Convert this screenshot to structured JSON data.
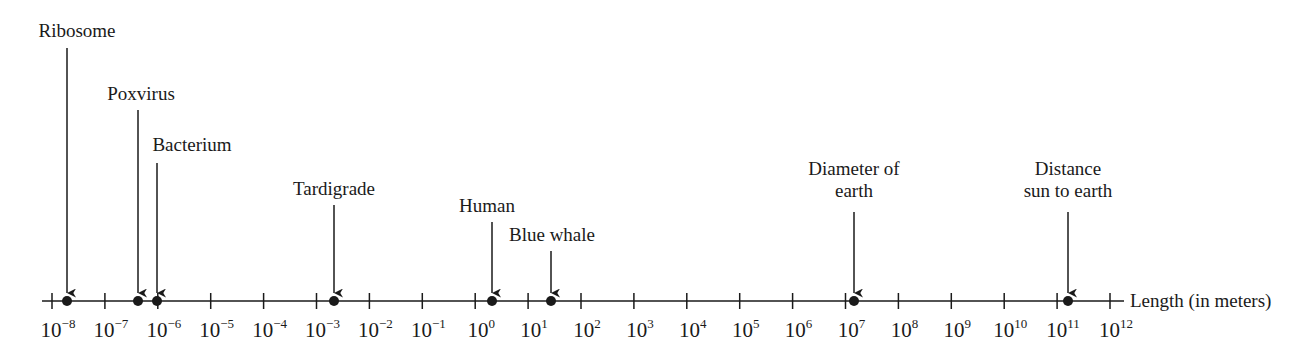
{
  "chart_data": {
    "type": "scatter",
    "title": "",
    "xlabel": "Length (in meters)",
    "scale": "log10",
    "xlim_exponents": [
      -8,
      12
    ],
    "tick_labels": [
      "10^-8",
      "10^-7",
      "10^-6",
      "10^-5",
      "10^-4",
      "10^-3",
      "10^-2",
      "10^-1",
      "10^0",
      "10^1",
      "10^2",
      "10^3",
      "10^4",
      "10^5",
      "10^6",
      "10^7",
      "10^8",
      "10^9",
      "10^10",
      "10^11",
      "10^12"
    ],
    "points": [
      {
        "label": "Ribosome",
        "log10_length_m": -7.7
      },
      {
        "label": "Poxvirus",
        "log10_length_m": -6.35
      },
      {
        "label": "Bacterium",
        "log10_length_m": -6.0
      },
      {
        "label": "Tardigrade",
        "log10_length_m": -2.6
      },
      {
        "label": "Human",
        "log10_length_m": 0.4
      },
      {
        "label": "Blue whale",
        "log10_length_m": 1.5
      },
      {
        "label": "Diameter of earth",
        "log10_length_m": 7.1
      },
      {
        "label": "Distance sun to earth",
        "log10_length_m": 11.2
      }
    ]
  },
  "axis": {
    "title": "Length (in meters)",
    "ticks": [
      {
        "base": "10",
        "exp": "−8"
      },
      {
        "base": "10",
        "exp": "−7"
      },
      {
        "base": "10",
        "exp": "−6"
      },
      {
        "base": "10",
        "exp": "−5"
      },
      {
        "base": "10",
        "exp": "−4"
      },
      {
        "base": "10",
        "exp": "−3"
      },
      {
        "base": "10",
        "exp": "−2"
      },
      {
        "base": "10",
        "exp": "−1"
      },
      {
        "base": "10",
        "exp": "0"
      },
      {
        "base": "10",
        "exp": "1"
      },
      {
        "base": "10",
        "exp": "2"
      },
      {
        "base": "10",
        "exp": "3"
      },
      {
        "base": "10",
        "exp": "4"
      },
      {
        "base": "10",
        "exp": "5"
      },
      {
        "base": "10",
        "exp": "6"
      },
      {
        "base": "10",
        "exp": "7"
      },
      {
        "base": "10",
        "exp": "8"
      },
      {
        "base": "10",
        "exp": "9"
      },
      {
        "base": "10",
        "exp": "10"
      },
      {
        "base": "10",
        "exp": "11"
      },
      {
        "base": "10",
        "exp": "12"
      }
    ]
  },
  "markers": [
    {
      "label_line1": "Ribosome",
      "label_line2": ""
    },
    {
      "label_line1": "Poxvirus",
      "label_line2": ""
    },
    {
      "label_line1": "Bacterium",
      "label_line2": ""
    },
    {
      "label_line1": "Tardigrade",
      "label_line2": ""
    },
    {
      "label_line1": "Human",
      "label_line2": ""
    },
    {
      "label_line1": "Blue whale",
      "label_line2": ""
    },
    {
      "label_line1": "Diameter of",
      "label_line2": "earth"
    },
    {
      "label_line1": "Distance",
      "label_line2": "sun to earth"
    }
  ],
  "colors": {
    "ink": "#1a1a1a",
    "background": "#ffffff"
  }
}
